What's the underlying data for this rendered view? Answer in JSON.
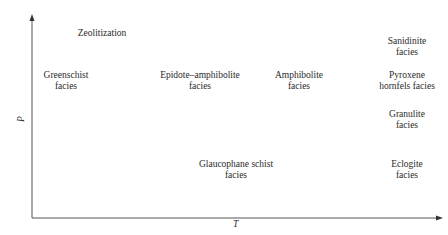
{
  "diagram": {
    "type": "metamorphic facies P-T diagram",
    "axes": {
      "x_label": "T",
      "y_label": "P"
    },
    "facies": [
      {
        "id": "zeolitization",
        "lines": [
          "Zeolitization"
        ],
        "x": 102,
        "y": 28
      },
      {
        "id": "greenschist",
        "lines": [
          "Greenschist",
          "facies"
        ],
        "x": 66,
        "y": 70
      },
      {
        "id": "epidote-amphibolite",
        "lines": [
          "Epidote–amphibolite",
          "facies"
        ],
        "x": 200,
        "y": 70
      },
      {
        "id": "amphibolite",
        "lines": [
          "Amphibolite",
          "facies"
        ],
        "x": 299,
        "y": 70
      },
      {
        "id": "sanidinite",
        "lines": [
          "Sanidinite",
          "facies"
        ],
        "x": 407,
        "y": 36
      },
      {
        "id": "pyroxene-hornfels",
        "lines": [
          "Pyroxene",
          "hornfels facies"
        ],
        "x": 407,
        "y": 70
      },
      {
        "id": "granulite",
        "lines": [
          "Granulite",
          "facies"
        ],
        "x": 407,
        "y": 109
      },
      {
        "id": "glaucophane-schist",
        "lines": [
          "Glaucophane schist",
          "facies"
        ],
        "x": 236,
        "y": 159
      },
      {
        "id": "eclogite",
        "lines": [
          "Eclogite",
          "facies"
        ],
        "x": 407,
        "y": 159
      }
    ],
    "colors": {
      "axis": "#555555",
      "text": "#2a2a2a",
      "background": "#ffffff"
    }
  }
}
